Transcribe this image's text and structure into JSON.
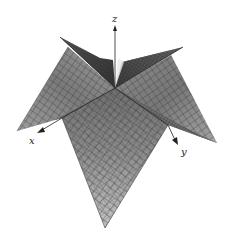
{
  "figure": {
    "type": "3d-surface-plot",
    "axes": {
      "x": {
        "label": "x"
      },
      "y": {
        "label": "y"
      },
      "z": {
        "label": "z"
      }
    },
    "colors": {
      "background": "#ffffff",
      "surface_light": "#bdbdbd",
      "surface_mid": "#8f8f8f",
      "surface_dark": "#5a5a5a",
      "mesh_line": "#3a3a3a",
      "axis": "#222222"
    }
  }
}
